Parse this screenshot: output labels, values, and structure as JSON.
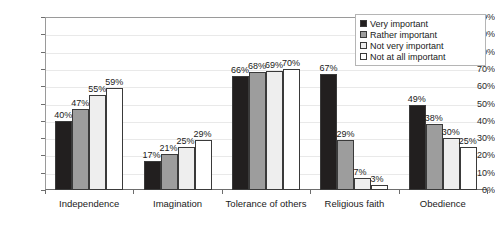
{
  "chart_data": {
    "type": "bar",
    "title": "",
    "subtitle": "",
    "xlabel": "",
    "ylabel": "",
    "ylim": [
      0,
      100
    ],
    "ytick_labels": [
      "0%",
      "10%",
      "20%",
      "30%",
      "40%",
      "50%",
      "60%",
      "70%",
      "80%",
      "90%",
      "100%"
    ],
    "ytick_values": [
      0,
      10,
      20,
      30,
      40,
      50,
      60,
      70,
      80,
      90,
      100
    ],
    "grid": true,
    "legend_position": "top-right",
    "value_suffix": "%",
    "categories": [
      "Independence",
      "Imagination",
      "Tolerance of others",
      "Religious faith",
      "Obedience"
    ],
    "series": [
      {
        "name": "Very important",
        "color": "#221f1f",
        "values": [
          40,
          17,
          66,
          67,
          49
        ],
        "labels": [
          "40%",
          "17%",
          "66%",
          "67%",
          "49%"
        ]
      },
      {
        "name": "Rather important",
        "color": "#9d9d9d",
        "values": [
          47,
          21,
          68,
          29,
          38
        ],
        "labels": [
          "47%",
          "21%",
          "68%",
          "29%",
          "38%"
        ]
      },
      {
        "name": "Not very important",
        "color": "#eeeeee",
        "values": [
          55,
          25,
          69,
          7,
          30
        ],
        "labels": [
          "55%",
          "25%",
          "69%",
          "7%",
          "30%"
        ]
      },
      {
        "name": "Not at all important",
        "color": "#ffffff",
        "values": [
          59,
          29,
          70,
          3,
          25
        ],
        "labels": [
          "59%",
          "29%",
          "70%",
          "3%",
          "25%"
        ]
      }
    ]
  }
}
